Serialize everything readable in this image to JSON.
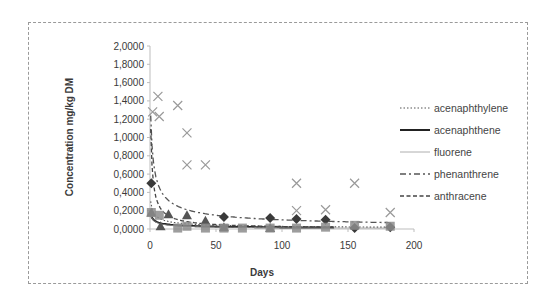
{
  "chart_data": {
    "type": "scatter",
    "title": "",
    "xlabel": "Days",
    "ylabel": "Concentration mg/kg DM",
    "xlim": [
      0,
      200
    ],
    "ylim": [
      0,
      2.0
    ],
    "x_ticks": [
      "0",
      "50",
      "100",
      "150",
      "200"
    ],
    "y_ticks": [
      "0,0000",
      "0,2000",
      "0,4000",
      "0,6000",
      "0,8000",
      "1,0000",
      "1,2000",
      "1,4000",
      "1,6000",
      "1,8000",
      "2,0000"
    ],
    "grid": false,
    "legend_position": "right",
    "legend": [
      {
        "name": "acenaphthylene",
        "style": "dotted"
      },
      {
        "name": "acenaphthene",
        "style": "solid"
      },
      {
        "name": "fluorene",
        "style": "thin-solid"
      },
      {
        "name": "phenanthrene",
        "style": "dash-dot"
      },
      {
        "name": "anthracene",
        "style": "dashed"
      }
    ],
    "series": [
      {
        "name": "acenaphthylene",
        "marker": "diamond",
        "color": "#3a3a3a",
        "points": [
          [
            1,
            0.5
          ],
          [
            56,
            0.13
          ],
          [
            91,
            0.12
          ],
          [
            111,
            0.11
          ],
          [
            133,
            0.1
          ],
          [
            155,
            0.01
          ],
          [
            182,
            0.02
          ]
        ],
        "trend": {
          "type": "power",
          "start": 0.38,
          "end": 0.02,
          "x_end": 182
        }
      },
      {
        "name": "acenaphthene",
        "marker": "triangle",
        "color": "#555555",
        "points": [
          [
            1,
            0.18
          ],
          [
            8,
            0.03
          ],
          [
            14,
            0.16
          ],
          [
            28,
            0.15
          ],
          [
            42,
            0.09
          ],
          [
            56,
            0.02
          ],
          [
            91,
            0.01
          ]
        ],
        "trend": {
          "type": "power",
          "start": 0.2,
          "end": 0.015,
          "x_end": 140
        }
      },
      {
        "name": "fluorene",
        "marker": "square",
        "color": "#8c8c8c",
        "points": [
          [
            1,
            0.18
          ],
          [
            7,
            0.15
          ],
          [
            21,
            0.01
          ],
          [
            28,
            0.03
          ],
          [
            42,
            0.01
          ],
          [
            56,
            0.01
          ],
          [
            70,
            0.01
          ],
          [
            91,
            0.01
          ],
          [
            111,
            0.01
          ],
          [
            133,
            0.02
          ],
          [
            155,
            0.04
          ],
          [
            182,
            0.03
          ]
        ],
        "trend": {
          "type": "power",
          "start": 0.2,
          "end": 0.01,
          "x_end": 182
        }
      },
      {
        "name": "phenanthrene",
        "marker": "x",
        "color": "#9a9a9a",
        "points": [
          [
            2,
            1.28
          ],
          [
            6,
            1.45
          ],
          [
            7,
            1.23
          ],
          [
            21,
            1.35
          ],
          [
            28,
            1.05
          ],
          [
            28,
            0.7
          ],
          [
            42,
            0.7
          ],
          [
            111,
            0.5
          ],
          [
            111,
            0.2
          ],
          [
            133,
            0.21
          ],
          [
            155,
            0.5
          ],
          [
            182,
            0.18
          ]
        ],
        "trend": {
          "type": "power",
          "start": 1.58,
          "end": 0.07,
          "x_end": 182
        }
      },
      {
        "name": "anthracene",
        "marker": "none",
        "color": "#555555",
        "points": [],
        "trend": {
          "type": "power",
          "start": 1.56,
          "end": 0.02,
          "x_end": 140
        }
      }
    ]
  }
}
